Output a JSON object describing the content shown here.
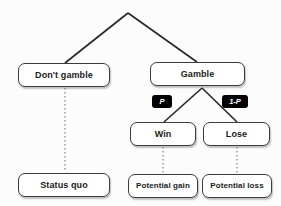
{
  "diagram": {
    "type": "decision-tree",
    "root": {
      "apex_label": ""
    },
    "nodes": {
      "dont_gamble": "Don't gamble",
      "gamble": "Gamble",
      "win": "Win",
      "lose": "Lose",
      "status_quo": "Status quo",
      "potential_gain": "Potential gain",
      "potential_loss": "Potential loss"
    },
    "probability_labels": {
      "win_branch": "P",
      "lose_branch": "1-P"
    },
    "colors": {
      "node_border": "#3c3c3c",
      "node_fill": "#ffffff",
      "node_text": "#1a1a1a",
      "badge_fill": "#000000",
      "badge_text": "#ffffff",
      "edge_solid": "#262626",
      "edge_dotted": "#808080",
      "background": "#fcfcfc"
    },
    "edges": [
      {
        "from": "root-apex",
        "to": "dont_gamble",
        "style": "solid"
      },
      {
        "from": "root-apex",
        "to": "gamble",
        "style": "solid"
      },
      {
        "from": "gamble",
        "to": "win",
        "style": "solid",
        "label": "P"
      },
      {
        "from": "gamble",
        "to": "lose",
        "style": "solid",
        "label": "1-P"
      },
      {
        "from": "dont_gamble",
        "to": "status_quo",
        "style": "dotted"
      },
      {
        "from": "win",
        "to": "potential_gain",
        "style": "dotted"
      },
      {
        "from": "lose",
        "to": "potential_loss",
        "style": "dotted"
      }
    ]
  }
}
